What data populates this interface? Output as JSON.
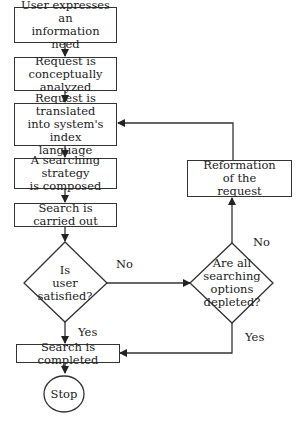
{
  "diagram": {
    "type": "flowchart",
    "nodes": {
      "n1": "User expresses an information need",
      "n1_line1": "User expresses an",
      "n1_line2": "information need",
      "n2_line1": "Request is",
      "n2_line2": "conceptually analyzed",
      "n3_line1": "Request is translated",
      "n3_line2": "into system's index",
      "n3_line3": "language",
      "n4_line1": "A searching strategy",
      "n4_line2": "is composed",
      "n5": "Search is carried out",
      "d1_line1": "Is",
      "d1_line2": "user",
      "d1_line3": "satisfied?",
      "d2_line1": "Are all",
      "d2_line2": "searching",
      "d2_line3": "options",
      "d2_line4": "depleted?",
      "r_line1": "Reformation",
      "r_line2": "of the",
      "r_line3": "request",
      "n6": "Search is completed",
      "stop": "Stop"
    },
    "edge_labels": {
      "d1_no": "No",
      "d1_yes": "Yes",
      "d2_no": "No",
      "d2_yes": "Yes"
    },
    "edges": [
      [
        "User expresses an information need",
        "Request is conceptually analyzed"
      ],
      [
        "Request is conceptually analyzed",
        "Request is translated into system's index language"
      ],
      [
        "Request is translated into system's index language",
        "A searching strategy is composed"
      ],
      [
        "A searching strategy is composed",
        "Search is carried out"
      ],
      [
        "Search is carried out",
        "Is user satisfied?"
      ],
      [
        "Is user satisfied?",
        "Search is completed",
        "Yes"
      ],
      [
        "Is user satisfied?",
        "Are all searching options depleted?",
        "No"
      ],
      [
        "Are all searching options depleted?",
        "Reformation of the request",
        "No"
      ],
      [
        "Are all searching options depleted?",
        "Search is completed",
        "Yes"
      ],
      [
        "Reformation of the request",
        "Request is translated into system's index language"
      ],
      [
        "Search is completed",
        "Stop"
      ]
    ],
    "colors": {
      "line": "#333333",
      "text": "#222222",
      "background": "#ffffff"
    }
  }
}
